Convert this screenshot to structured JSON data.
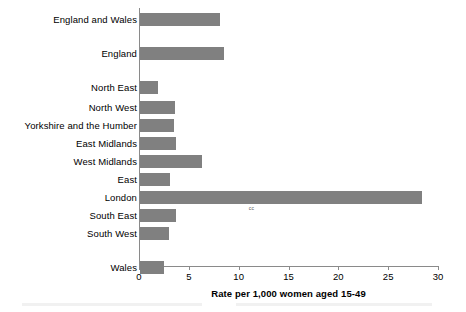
{
  "chart_data": {
    "type": "bar",
    "orientation": "horizontal",
    "title": "",
    "xlabel": "Rate per 1,000 women aged 15-49",
    "ylabel": "",
    "xlim": [
      0,
      30
    ],
    "xticks": [
      0,
      5,
      10,
      15,
      20,
      25,
      30
    ],
    "xtick_labels": [
      "0",
      "5",
      "10",
      "15",
      "20",
      "25",
      "30"
    ],
    "grid": false,
    "legend": false,
    "bar_color": "#808080",
    "axis_color": "#8a8a8a",
    "categories": [
      "England and Wales",
      "England",
      "North East",
      "North West",
      "Yorkshire and the Humber",
      "East Midlands",
      "West Midlands",
      "East",
      "London",
      "South East",
      "South West",
      "Wales"
    ],
    "values": [
      8.0,
      8.4,
      1.8,
      3.5,
      3.4,
      3.6,
      6.2,
      3.0,
      28.3,
      3.6,
      2.9,
      2.4
    ],
    "annotations": [
      {
        "text": "cc",
        "attached_to": "London",
        "x_value": 11.0
      }
    ],
    "group_gaps_after": [
      "England and Wales",
      "England",
      "South West"
    ]
  },
  "rows": [
    {
      "label": "England and Wales",
      "value": 8.0,
      "top": 4
    },
    {
      "label": "England",
      "value": 8.4,
      "top": 38
    },
    {
      "label": "North East",
      "value": 1.8,
      "top": 72
    },
    {
      "label": "North West",
      "value": 3.5,
      "top": 92
    },
    {
      "label": "Yorkshire and the Humber",
      "value": 3.4,
      "top": 110
    },
    {
      "label": "East Midlands",
      "value": 3.6,
      "top": 128
    },
    {
      "label": "West Midlands",
      "value": 6.2,
      "top": 146
    },
    {
      "label": "East",
      "value": 3.0,
      "top": 164
    },
    {
      "label": "London",
      "value": 28.3,
      "top": 182
    },
    {
      "label": "South East",
      "value": 3.6,
      "top": 200
    },
    {
      "label": "South West",
      "value": 2.9,
      "top": 218
    },
    {
      "label": "Wales",
      "value": 2.4,
      "top": 252
    }
  ],
  "axis": {
    "title": "Rate per 1,000 women aged 15-49",
    "ticks": [
      "0",
      "5",
      "10",
      "15",
      "20",
      "25",
      "30"
    ]
  },
  "annotation": {
    "label": "cc"
  }
}
